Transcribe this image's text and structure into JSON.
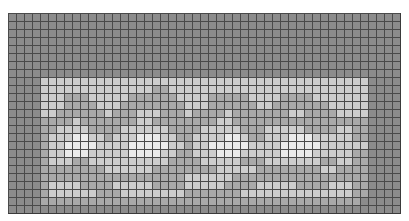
{
  "mosaic": {
    "columns": 49,
    "rows": 25,
    "cell_size_px": 8,
    "palette": {
      "0": "#8c8c8c",
      "1": "#a9a9a9",
      "2": "#cdcdcd",
      "3": "#ebebeb"
    },
    "grid_line_color": "#3a3a3a",
    "map": [
      "0000000000000000000000000000000000000000000000000",
      "0000000000000000000000000000000000000000000000000",
      "0000000000000000000000000000000000000000000000000",
      "0000000000000000000000000000000000000000000000000",
      "0000000000000000000000000000000000000000000000000",
      "0000000000000000000000000000000000000000000000000",
      "0000000000000000000000000000000000000000000000000",
      "0000000000000000000000000000000000000000000000000",
      "0000222222222222222222222222222222222222222220000",
      "0000222222222222221122222222222222222222222220000",
      "0000222111222221111112222111112222111122222220000",
      "0000222111122211111111222111111221111111222220000",
      "0000221111112111222111211112111111122111122220000",
      "0000111121111111221111111122111111111111111110000",
      "0000112222111122222211112222211122222111122110000",
      "0000122233221222333221122223321122233322222110000",
      "0000122333322223333322122333332222333332222220000",
      "0000122333222223333221122233322222333322222110000",
      "0000122211222222222211112222211122222221122110000",
      "0000111111112222221111111122222111111112211110000",
      "0000111111111111111111222222111111111111111110000",
      "0000122221111222221111222221111222221111222110000",
      "0000122222211122222222111111122222222222222110000",
      "0000111111111111111111111111111111111111111100000",
      "0000000000000000000000000000000000000000000000000"
    ]
  }
}
